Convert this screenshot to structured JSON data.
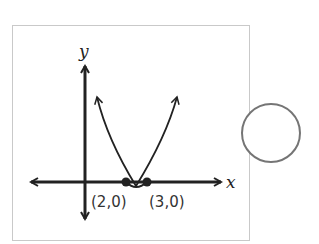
{
  "diagram": {
    "type": "graph-of-parabola",
    "axes": {
      "x_label": "x",
      "y_label": "y"
    },
    "curve": "upward-opening parabola with arrowheads at both ends",
    "points": [
      {
        "label": "(2,0)",
        "x": 2,
        "y": 0
      },
      {
        "label": "(3,0)",
        "x": 3,
        "y": 0
      }
    ],
    "answer_option": {
      "shape": "circle",
      "state": "unselected"
    }
  },
  "colors": {
    "stroke": "#222222",
    "frame": "#c9c9c9",
    "circle": "#757575"
  }
}
